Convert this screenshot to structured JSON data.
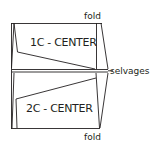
{
  "diagram": {
    "type": "fabric-layout",
    "labels": {
      "fold_top": "fold",
      "fold_bottom": "fold",
      "selvages": "selvages",
      "piece_top": "1C - CENTER",
      "piece_bottom": "2C - CENTER"
    },
    "colors": {
      "line": "#231f20",
      "background": "#ffffff"
    }
  }
}
